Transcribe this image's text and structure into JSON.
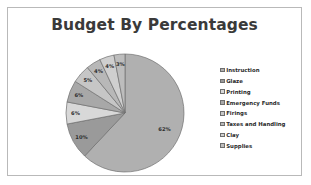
{
  "chart_data": {
    "type": "pie",
    "title": "Budget By Percentages",
    "categories": [
      "Instruction",
      "Glaze",
      "Printing",
      "Emergency Funds",
      "Firings",
      "Taxes and Handling",
      "Clay",
      "Supplies"
    ],
    "values": [
      62,
      10,
      6,
      6,
      5,
      4,
      4,
      3
    ],
    "value_labels": [
      "62%",
      "10%",
      "6%",
      "6%",
      "5%",
      "4%",
      "4%",
      "3%"
    ],
    "slice_colors": [
      "#b0b0b0",
      "#9a9a9a",
      "#d8d8d8",
      "#a8a8a8",
      "#c6c6c6",
      "#b8b8b8",
      "#cfcfcf",
      "#bdbdbd"
    ],
    "legend_position": "right",
    "grid": false,
    "xlabel": "",
    "ylabel": "",
    "start_angle_deg": 0,
    "direction": "clockwise"
  },
  "frame": {
    "border_color": "#b9b9b9",
    "background": "#ffffff"
  },
  "icons": {
    "legend_swatch": "legend-swatch-icon"
  }
}
